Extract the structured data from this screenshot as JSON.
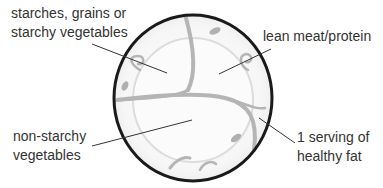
{
  "diagram": {
    "plate": {
      "shape": "ellipse",
      "center": [
        193,
        98
      ],
      "radii": [
        79,
        83
      ],
      "rim_color": "#1a1a1a",
      "decoration_color": "#b8b8b8"
    },
    "labels": [
      {
        "id": "starches",
        "lines": [
          "starches, grains or",
          "starchy vegetables"
        ],
        "pointer_from": [
          92,
          44
        ],
        "pointer_to": [
          167,
          73
        ]
      },
      {
        "id": "protein",
        "lines": [
          "lean meat/protein"
        ],
        "pointer_from": [
          271,
          49
        ],
        "pointer_to": [
          219,
          74
        ]
      },
      {
        "id": "non-starchy",
        "lines": [
          "non-starchy",
          "vegetables"
        ],
        "pointer_from": [
          92,
          146
        ],
        "pointer_to": [
          192,
          120
        ]
      },
      {
        "id": "fat",
        "lines": [
          "1 serving of",
          "healthy fat"
        ],
        "pointer_from": [
          295,
          143
        ],
        "pointer_to": [
          259,
          118
        ]
      }
    ]
  }
}
